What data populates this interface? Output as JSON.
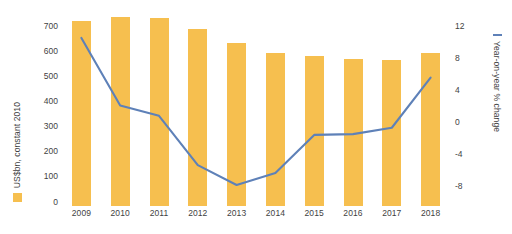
{
  "chart_data": {
    "type": "bar",
    "title": "",
    "categories": [
      "2009",
      "2010",
      "2011",
      "2012",
      "2013",
      "2014",
      "2015",
      "2016",
      "2017",
      "2018"
    ],
    "series": [
      {
        "name": "US$bn, constant 2010",
        "type": "bar",
        "axis": "left",
        "color": "#F6BF4F",
        "values": [
          695,
          710,
          707,
          665,
          613,
          575,
          563,
          555,
          549,
          575
        ]
      },
      {
        "name": "Year-on-year % change",
        "type": "line",
        "axis": "right",
        "color": "#5E81B8",
        "values": [
          10.5,
          2.0,
          0.7,
          -5.5,
          -8.0,
          -6.5,
          -1.7,
          -1.6,
          -0.8,
          5.5
        ]
      }
    ],
    "xlabel": "",
    "ylabel": "US$bn, constant 2010",
    "y2label": "Year-on-year % change",
    "ylim": [
      0,
      700
    ],
    "y2lim": [
      -8,
      12
    ],
    "yticks": [
      0,
      100,
      200,
      300,
      400,
      500,
      600,
      700
    ],
    "y2ticks": [
      -8,
      -4,
      0,
      4,
      8,
      12
    ],
    "grid": false,
    "legend_position": "outside-left-and-right"
  },
  "axis_left": {
    "title": "US$bn, constant 2010",
    "ticks": [
      "700",
      "600",
      "500",
      "400",
      "300",
      "200",
      "100",
      "0"
    ]
  },
  "axis_right": {
    "title": "Year-on-year % change",
    "ticks": [
      "12",
      "8",
      "4",
      "0",
      "-4",
      "-8"
    ]
  },
  "axis_x": {
    "ticks": [
      "2009",
      "2010",
      "2011",
      "2012",
      "2013",
      "2014",
      "2015",
      "2016",
      "2017",
      "2018"
    ]
  },
  "colors": {
    "bar": "#F6BF4F",
    "line": "#5E81B8",
    "text": "#3f3f3f",
    "background": "#ffffff"
  }
}
